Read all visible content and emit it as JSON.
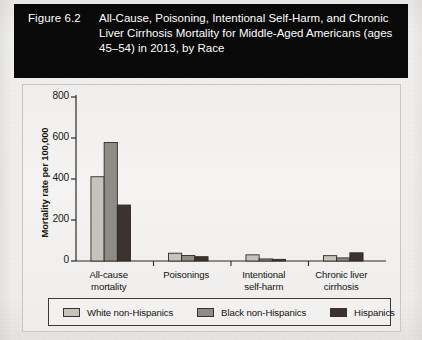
{
  "figure": {
    "number": "Figure 6.2",
    "title": "All-Cause, Poisoning, Intentional Self-Harm, and Chronic Liver Cirrhosis Mortality for Middle-Aged Americans (ages 45–54) in 2013, by Race"
  },
  "chart_data": {
    "type": "bar",
    "xlabel": "",
    "ylabel": "Mortality rate per 100,000",
    "ylim": [
      0,
      800
    ],
    "yticks": [
      0,
      200,
      400,
      600,
      800
    ],
    "ytick_labels": [
      "0",
      "200",
      "400",
      "600",
      "800"
    ],
    "grid": false,
    "legend_position": "bottom",
    "categories": [
      "All-cause mortality",
      "Poisonings",
      "Intentional self-harm",
      "Chronic liver cirrhosis"
    ],
    "category_lines": [
      [
        "All-cause",
        "mortality"
      ],
      [
        "Poisonings",
        ""
      ],
      [
        "Intentional",
        "self-harm"
      ],
      [
        "Chronic liver",
        "cirrhosis"
      ]
    ],
    "series": [
      {
        "name": "White non-Hispanics",
        "color": "#c6c3bd",
        "values": [
          411,
          38,
          30,
          26
        ]
      },
      {
        "name": "Black non-Hispanics",
        "color": "#8f8c88",
        "values": [
          578,
          27,
          10,
          15
        ]
      },
      {
        "name": "Hispanics",
        "color": "#3c332f",
        "values": [
          273,
          21,
          8,
          40
        ]
      }
    ]
  },
  "legend": {
    "items": [
      {
        "label": "White non-Hispanics",
        "color": "#c6c3bd"
      },
      {
        "label": "Black non-Hispanics",
        "color": "#8f8c88"
      },
      {
        "label": "Hispanics",
        "color": "#3c332f"
      }
    ]
  }
}
